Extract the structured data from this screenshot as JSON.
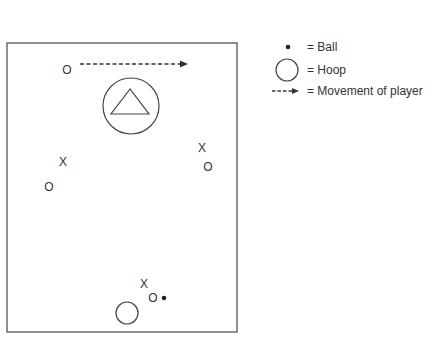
{
  "diagram": {
    "court": {
      "x": 7,
      "y": 43,
      "width": 230,
      "height": 289
    },
    "players": [
      {
        "symbol": "O",
        "x": 67,
        "y": 70
      },
      {
        "symbol": "X",
        "x": 63,
        "y": 162
      },
      {
        "symbol": "O",
        "x": 49,
        "y": 187
      },
      {
        "symbol": "X",
        "x": 202,
        "y": 148
      },
      {
        "symbol": "O",
        "x": 208,
        "y": 167
      },
      {
        "symbol": "X",
        "x": 144,
        "y": 284
      },
      {
        "symbol": "O",
        "x": 153,
        "y": 298
      }
    ],
    "ball": {
      "x": 164,
      "y": 298
    },
    "hoop_bottom": {
      "x": 127,
      "y": 313,
      "r": 11
    },
    "hoop_top": {
      "x": 131,
      "y": 106,
      "r": 28
    },
    "movement_arrow": {
      "x1": 80,
      "y1": 64,
      "x2": 187,
      "y2": 64
    }
  },
  "legend": {
    "ball_label": "= Ball",
    "hoop_label": "= Hoop",
    "movement_label": "= Movement of player"
  }
}
